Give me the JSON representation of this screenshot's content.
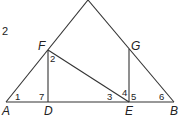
{
  "problem_number": "2",
  "points": {
    "A": "A",
    "B": "B",
    "D": "D",
    "E": "E",
    "F": "F",
    "G": "G"
  },
  "angles": {
    "a1": "1",
    "a2": "2",
    "a3": "3",
    "a4": "4",
    "a5": "5",
    "a6": "6",
    "a7": "7"
  },
  "colors": {
    "stroke": "#333333",
    "text": "#222222"
  }
}
